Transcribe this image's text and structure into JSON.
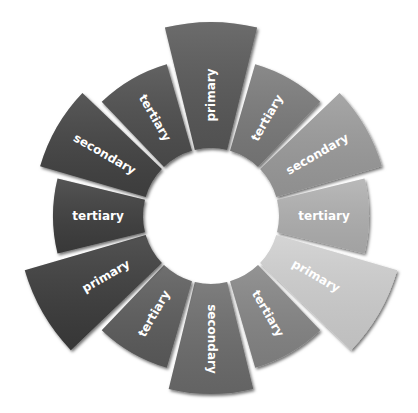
{
  "diagram": {
    "type": "color-wheel",
    "center": [
      211,
      216
    ],
    "inner_radius": 68,
    "outer_radius": {
      "primary": 194,
      "secondary": 178,
      "tertiary": 158
    },
    "gap_deg": 2.5,
    "segments": [
      {
        "label": "primary",
        "kind": "primary",
        "angle": 0,
        "color": "#585858"
      },
      {
        "label": "tertiary",
        "kind": "tertiary",
        "angle": 30,
        "color": "#7a7a7a"
      },
      {
        "label": "secondary",
        "kind": "secondary",
        "angle": 60,
        "color": "#9b9b9b"
      },
      {
        "label": "tertiary",
        "kind": "tertiary",
        "angle": 90,
        "color": "#b0b0b0"
      },
      {
        "label": "primary",
        "kind": "primary",
        "angle": 120,
        "color": "#cfcfcf"
      },
      {
        "label": "tertiary",
        "kind": "tertiary",
        "angle": 150,
        "color": "#858585"
      },
      {
        "label": "secondary",
        "kind": "secondary",
        "angle": 180,
        "color": "#6c6c6c"
      },
      {
        "label": "tertiary",
        "kind": "tertiary",
        "angle": 210,
        "color": "#5c5c5c"
      },
      {
        "label": "primary",
        "kind": "primary",
        "angle": 240,
        "color": "#3a3a3a"
      },
      {
        "label": "tertiary",
        "kind": "tertiary",
        "angle": 270,
        "color": "#3d3d3d"
      },
      {
        "label": "secondary",
        "kind": "secondary",
        "angle": 300,
        "color": "#434343"
      },
      {
        "label": "tertiary",
        "kind": "tertiary",
        "angle": 330,
        "color": "#4e4e4e"
      }
    ]
  }
}
